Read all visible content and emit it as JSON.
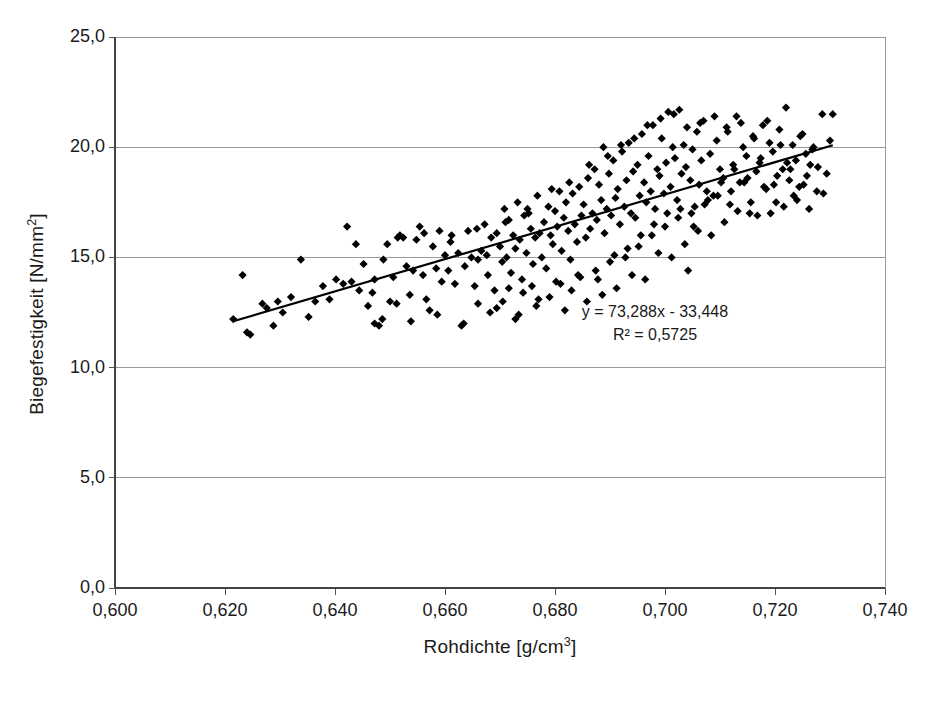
{
  "chart_data": {
    "type": "scatter",
    "title": "",
    "xlabel": "Rohdichte [g/cm",
    "xlabel_sup": "3",
    "xlabel_tail": "]",
    "ylabel": "Biegefestigkeit [N/mm",
    "ylabel_sup": "2",
    "ylabel_tail": "]",
    "xlim": [
      0.6,
      0.74
    ],
    "ylim": [
      0.0,
      25.0
    ],
    "xticks": [
      0.6,
      0.62,
      0.64,
      0.66,
      0.68,
      0.7,
      0.72,
      0.74
    ],
    "yticks": [
      0.0,
      5.0,
      10.0,
      15.0,
      20.0,
      25.0
    ],
    "xticklabels": [
      "0,600",
      "0,620",
      "0,640",
      "0,660",
      "0,680",
      "0,700",
      "0,720",
      "0,740"
    ],
    "yticklabels": [
      "0,0",
      "5,0",
      "10,0",
      "15,0",
      "20,0",
      "25,0"
    ],
    "grid": "horizontal",
    "legend": "none",
    "marker": "diamond",
    "marker_color": "#000000",
    "trendline": {
      "equation": "y = 73,288x - 33,448",
      "r_squared": "R² = 0,5725",
      "slope": 73.288,
      "intercept": -33.448,
      "x_start": 0.6215,
      "x_end": 0.7305,
      "color": "#000000"
    },
    "points": [
      [
        0.6215,
        12.2
      ],
      [
        0.6232,
        14.2
      ],
      [
        0.624,
        11.6
      ],
      [
        0.6246,
        11.5
      ],
      [
        0.6268,
        12.9
      ],
      [
        0.6276,
        12.7
      ],
      [
        0.6288,
        11.9
      ],
      [
        0.6296,
        13.0
      ],
      [
        0.6305,
        12.5
      ],
      [
        0.632,
        13.2
      ],
      [
        0.6338,
        14.9
      ],
      [
        0.6352,
        12.3
      ],
      [
        0.6364,
        13.0
      ],
      [
        0.6378,
        13.7
      ],
      [
        0.639,
        13.1
      ],
      [
        0.6402,
        14.0
      ],
      [
        0.6415,
        13.8
      ],
      [
        0.6422,
        16.4
      ],
      [
        0.643,
        13.9
      ],
      [
        0.6438,
        15.6
      ],
      [
        0.6444,
        13.5
      ],
      [
        0.6452,
        14.7
      ],
      [
        0.646,
        12.8
      ],
      [
        0.6468,
        13.4
      ],
      [
        0.6472,
        12.0
      ],
      [
        0.648,
        11.9
      ],
      [
        0.6488,
        14.9
      ],
      [
        0.6495,
        15.6
      ],
      [
        0.65,
        13.0
      ],
      [
        0.6506,
        14.1
      ],
      [
        0.6512,
        12.9
      ],
      [
        0.6518,
        16.0
      ],
      [
        0.6524,
        15.9
      ],
      [
        0.653,
        14.6
      ],
      [
        0.6536,
        13.3
      ],
      [
        0.6542,
        14.4
      ],
      [
        0.6548,
        15.8
      ],
      [
        0.6554,
        16.4
      ],
      [
        0.656,
        14.2
      ],
      [
        0.6566,
        13.1
      ],
      [
        0.6572,
        12.6
      ],
      [
        0.6578,
        15.5
      ],
      [
        0.6584,
        14.5
      ],
      [
        0.659,
        16.2
      ],
      [
        0.6594,
        13.9
      ],
      [
        0.66,
        15.1
      ],
      [
        0.6606,
        14.4
      ],
      [
        0.6612,
        16.0
      ],
      [
        0.6618,
        13.8
      ],
      [
        0.6624,
        15.2
      ],
      [
        0.663,
        11.9
      ],
      [
        0.6636,
        14.6
      ],
      [
        0.6642,
        16.2
      ],
      [
        0.6648,
        15.0
      ],
      [
        0.6654,
        13.7
      ],
      [
        0.666,
        14.9
      ],
      [
        0.6666,
        15.3
      ],
      [
        0.6672,
        16.5
      ],
      [
        0.6678,
        14.2
      ],
      [
        0.6684,
        15.9
      ],
      [
        0.669,
        13.5
      ],
      [
        0.6694,
        16.1
      ],
      [
        0.67,
        15.5
      ],
      [
        0.6704,
        14.8
      ],
      [
        0.6708,
        17.2
      ],
      [
        0.6712,
        15.0
      ],
      [
        0.6716,
        16.7
      ],
      [
        0.672,
        14.3
      ],
      [
        0.6724,
        16.0
      ],
      [
        0.6728,
        15.4
      ],
      [
        0.6732,
        17.5
      ],
      [
        0.6736,
        15.8
      ],
      [
        0.674,
        14.0
      ],
      [
        0.6744,
        16.9
      ],
      [
        0.6748,
        15.2
      ],
      [
        0.6752,
        17.0
      ],
      [
        0.6756,
        16.3
      ],
      [
        0.676,
        14.7
      ],
      [
        0.6764,
        15.9
      ],
      [
        0.6768,
        17.8
      ],
      [
        0.6772,
        16.1
      ],
      [
        0.6776,
        15.0
      ],
      [
        0.678,
        16.6
      ],
      [
        0.6784,
        14.5
      ],
      [
        0.6788,
        17.3
      ],
      [
        0.6792,
        16.0
      ],
      [
        0.6796,
        15.6
      ],
      [
        0.68,
        17.1
      ],
      [
        0.6804,
        16.4
      ],
      [
        0.6808,
        18.0
      ],
      [
        0.6812,
        15.3
      ],
      [
        0.6816,
        16.8
      ],
      [
        0.682,
        17.5
      ],
      [
        0.6824,
        16.2
      ],
      [
        0.6828,
        14.9
      ],
      [
        0.6832,
        17.9
      ],
      [
        0.6836,
        16.5
      ],
      [
        0.684,
        15.7
      ],
      [
        0.6844,
        18.2
      ],
      [
        0.6848,
        16.9
      ],
      [
        0.6852,
        17.4
      ],
      [
        0.6856,
        15.9
      ],
      [
        0.686,
        18.6
      ],
      [
        0.6864,
        16.3
      ],
      [
        0.6868,
        17.0
      ],
      [
        0.6872,
        19.0
      ],
      [
        0.6876,
        16.7
      ],
      [
        0.688,
        18.3
      ],
      [
        0.6884,
        17.6
      ],
      [
        0.6888,
        20.0
      ],
      [
        0.689,
        16.1
      ],
      [
        0.6894,
        17.2
      ],
      [
        0.6898,
        18.8
      ],
      [
        0.6902,
        16.9
      ],
      [
        0.6906,
        19.4
      ],
      [
        0.691,
        17.7
      ],
      [
        0.6914,
        18.1
      ],
      [
        0.6918,
        16.5
      ],
      [
        0.6922,
        19.8
      ],
      [
        0.6926,
        17.3
      ],
      [
        0.693,
        18.5
      ],
      [
        0.6934,
        20.2
      ],
      [
        0.6938,
        17.0
      ],
      [
        0.6942,
        18.9
      ],
      [
        0.6946,
        16.8
      ],
      [
        0.695,
        19.2
      ],
      [
        0.6954,
        17.8
      ],
      [
        0.6958,
        20.6
      ],
      [
        0.6962,
        18.4
      ],
      [
        0.6966,
        17.5
      ],
      [
        0.697,
        19.6
      ],
      [
        0.6974,
        18.0
      ],
      [
        0.6978,
        21.0
      ],
      [
        0.6982,
        17.2
      ],
      [
        0.6986,
        19.0
      ],
      [
        0.699,
        18.7
      ],
      [
        0.6994,
        20.4
      ],
      [
        0.6998,
        17.9
      ],
      [
        0.7002,
        19.3
      ],
      [
        0.7006,
        21.6
      ],
      [
        0.701,
        18.2
      ],
      [
        0.7014,
        20.0
      ],
      [
        0.7018,
        19.5
      ],
      [
        0.7022,
        17.6
      ],
      [
        0.7026,
        21.7
      ],
      [
        0.703,
        18.8
      ],
      [
        0.7034,
        20.1
      ],
      [
        0.7038,
        19.1
      ],
      [
        0.7042,
        14.4
      ],
      [
        0.7046,
        18.5
      ],
      [
        0.705,
        19.9
      ],
      [
        0.7054,
        17.3
      ],
      [
        0.7058,
        20.7
      ],
      [
        0.7062,
        18.3
      ],
      [
        0.7066,
        19.4
      ],
      [
        0.707,
        21.2
      ],
      [
        0.7076,
        18.0
      ],
      [
        0.7082,
        19.7
      ],
      [
        0.7088,
        17.8
      ],
      [
        0.7094,
        20.3
      ],
      [
        0.71,
        19.0
      ],
      [
        0.7106,
        18.6
      ],
      [
        0.7112,
        20.9
      ],
      [
        0.7118,
        17.4
      ],
      [
        0.7124,
        19.2
      ],
      [
        0.713,
        21.4
      ],
      [
        0.7136,
        18.4
      ],
      [
        0.7142,
        20.0
      ],
      [
        0.7148,
        19.6
      ],
      [
        0.7154,
        17.0
      ],
      [
        0.716,
        20.5
      ],
      [
        0.7166,
        18.9
      ],
      [
        0.7172,
        19.3
      ],
      [
        0.7178,
        21.0
      ],
      [
        0.7184,
        18.1
      ],
      [
        0.719,
        20.2
      ],
      [
        0.7196,
        19.8
      ],
      [
        0.7202,
        17.5
      ],
      [
        0.7208,
        20.8
      ],
      [
        0.7214,
        19.0
      ],
      [
        0.722,
        21.8
      ],
      [
        0.7226,
        18.5
      ],
      [
        0.7232,
        20.1
      ],
      [
        0.7238,
        19.4
      ],
      [
        0.7244,
        18.2
      ],
      [
        0.725,
        20.6
      ],
      [
        0.7256,
        19.7
      ],
      [
        0.7262,
        17.2
      ],
      [
        0.727,
        20.0
      ],
      [
        0.7278,
        19.1
      ],
      [
        0.7286,
        21.5
      ],
      [
        0.7294,
        18.8
      ],
      [
        0.73,
        20.3
      ],
      [
        0.7305,
        21.5
      ],
      [
        0.666,
        12.9
      ],
      [
        0.6682,
        12.5
      ],
      [
        0.6705,
        13.0
      ],
      [
        0.6716,
        13.6
      ],
      [
        0.6728,
        12.2
      ],
      [
        0.6742,
        13.4
      ],
      [
        0.6758,
        13.7
      ],
      [
        0.6766,
        12.8
      ],
      [
        0.679,
        13.2
      ],
      [
        0.6802,
        13.9
      ],
      [
        0.6818,
        12.6
      ],
      [
        0.683,
        13.5
      ],
      [
        0.6846,
        14.1
      ],
      [
        0.6858,
        13.0
      ],
      [
        0.6874,
        14.4
      ],
      [
        0.6886,
        13.3
      ],
      [
        0.69,
        14.8
      ],
      [
        0.6912,
        13.6
      ],
      [
        0.6928,
        15.0
      ],
      [
        0.694,
        14.2
      ],
      [
        0.6952,
        15.5
      ],
      [
        0.6964,
        14.0
      ],
      [
        0.6976,
        16.0
      ],
      [
        0.6988,
        15.2
      ],
      [
        0.7,
        16.4
      ],
      [
        0.7012,
        15.0
      ],
      [
        0.7024,
        16.8
      ],
      [
        0.7036,
        15.6
      ],
      [
        0.7048,
        17.0
      ],
      [
        0.706,
        16.2
      ],
      [
        0.7072,
        17.4
      ],
      [
        0.7084,
        16.0
      ],
      [
        0.7096,
        17.8
      ],
      [
        0.7108,
        16.6
      ],
      [
        0.712,
        18.0
      ],
      [
        0.7132,
        17.1
      ],
      [
        0.7144,
        18.4
      ],
      [
        0.7156,
        17.5
      ],
      [
        0.7168,
        16.9
      ],
      [
        0.718,
        18.2
      ],
      [
        0.7192,
        17.0
      ],
      [
        0.7204,
        18.7
      ],
      [
        0.7216,
        17.3
      ],
      [
        0.7228,
        19.0
      ],
      [
        0.724,
        17.6
      ],
      [
        0.7252,
        18.3
      ],
      [
        0.7264,
        19.2
      ],
      [
        0.7276,
        18.0
      ],
      [
        0.7288,
        17.9
      ],
      [
        0.6472,
        14.0
      ],
      [
        0.6486,
        12.2
      ],
      [
        0.6514,
        15.9
      ],
      [
        0.6538,
        12.1
      ],
      [
        0.6562,
        16.1
      ],
      [
        0.6586,
        12.4
      ],
      [
        0.661,
        15.7
      ],
      [
        0.6634,
        12.0
      ],
      [
        0.6658,
        16.3
      ],
      [
        0.6676,
        15.1
      ],
      [
        0.6694,
        12.7
      ],
      [
        0.671,
        16.6
      ],
      [
        0.6734,
        12.4
      ],
      [
        0.675,
        17.2
      ],
      [
        0.677,
        13.1
      ],
      [
        0.6794,
        18.1
      ],
      [
        0.681,
        13.8
      ],
      [
        0.6826,
        18.4
      ],
      [
        0.6842,
        14.2
      ],
      [
        0.6862,
        19.2
      ],
      [
        0.6878,
        14.0
      ],
      [
        0.6896,
        19.6
      ],
      [
        0.6908,
        15.1
      ],
      [
        0.692,
        20.1
      ],
      [
        0.6932,
        15.4
      ],
      [
        0.6944,
        20.4
      ],
      [
        0.6956,
        16.0
      ],
      [
        0.6968,
        21.0
      ],
      [
        0.698,
        16.5
      ],
      [
        0.6992,
        21.3
      ],
      [
        0.7004,
        17.0
      ],
      [
        0.7016,
        21.5
      ],
      [
        0.7028,
        17.2
      ],
      [
        0.704,
        20.9
      ],
      [
        0.7052,
        16.4
      ],
      [
        0.7064,
        21.1
      ],
      [
        0.7078,
        17.6
      ],
      [
        0.709,
        21.4
      ],
      [
        0.7102,
        18.4
      ],
      [
        0.7114,
        20.7
      ],
      [
        0.7126,
        19.0
      ],
      [
        0.7138,
        21.1
      ],
      [
        0.715,
        18.6
      ],
      [
        0.7162,
        20.4
      ],
      [
        0.7174,
        19.5
      ],
      [
        0.7186,
        21.2
      ],
      [
        0.7198,
        18.3
      ],
      [
        0.721,
        20.1
      ],
      [
        0.7222,
        19.3
      ],
      [
        0.7234,
        17.8
      ],
      [
        0.7246,
        20.5
      ],
      [
        0.7258,
        18.7
      ],
      [
        0.7268,
        19.9
      ]
    ]
  }
}
